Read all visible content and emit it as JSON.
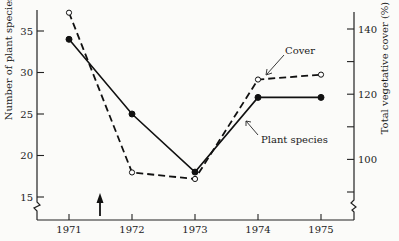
{
  "chart_data": {
    "type": "line",
    "title": "",
    "x": [
      1971,
      1972,
      1973,
      1974,
      1975
    ],
    "xlabel": "",
    "x_tick_labels": [
      "1971",
      "1972",
      "1973",
      "1974",
      "1975"
    ],
    "xlim": [
      1970.5,
      1975.5
    ],
    "y_left": {
      "label": "Number of plant species",
      "ticks": [
        15,
        20,
        25,
        30,
        35
      ],
      "tick_labels": [
        "15",
        "20",
        "25",
        "30",
        "35"
      ],
      "range": [
        13.5,
        37.5
      ],
      "axis_break": true
    },
    "y_right": {
      "label": "Total vegetative cover (%)",
      "ticks": [
        90,
        100,
        110,
        120,
        130,
        140
      ],
      "tick_labels": [
        "",
        "100",
        "",
        "120",
        "",
        "140"
      ],
      "range": [
        86,
        148
      ],
      "axis_break": true
    },
    "series": [
      {
        "name": "Plant species",
        "axis": "left",
        "style": "solid",
        "marker": "filled-circle",
        "values": [
          34,
          25,
          18,
          27,
          27
        ]
      },
      {
        "name": "Cover",
        "axis": "right",
        "style": "dashed",
        "marker": "open-circle",
        "values": [
          145,
          96,
          94,
          124.5,
          126
        ]
      }
    ],
    "annotations": [
      {
        "text": "Cover",
        "points_to_series": "Cover",
        "near_x": 1974
      },
      {
        "text": "Plant species",
        "points_to_series": "Plant species",
        "near_x": 1974
      },
      {
        "text": "",
        "type": "arrow-up",
        "x": 1971.5,
        "meaning": "event marker"
      }
    ],
    "grid": false,
    "legend": "none (inline labels)"
  }
}
